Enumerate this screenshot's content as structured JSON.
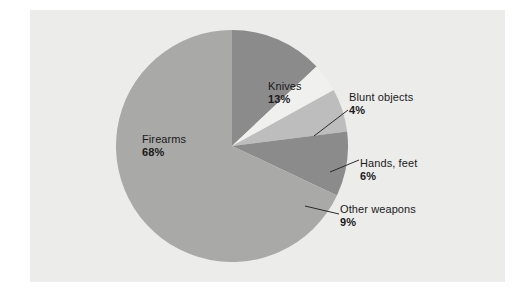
{
  "figure": {
    "background_color": "#ffffff",
    "panel_color": "#ececeb"
  },
  "chart_data": {
    "type": "pie",
    "title": "",
    "subtitle": "",
    "xlabel": "",
    "ylabel": "",
    "legend_position": "none",
    "grid": false,
    "units": "percent",
    "total": 100,
    "start_angle_deg": 0,
    "direction": "clockwise",
    "categories": [
      "Knives",
      "Blunt objects",
      "Hands, feet",
      "Other weapons",
      "Firearms"
    ],
    "values": [
      13,
      4,
      6,
      9,
      68
    ],
    "labels": [
      "13%",
      "4%",
      "6%",
      "9%",
      "68%"
    ],
    "colors": [
      "#8b8b8b",
      "#f0f0ee",
      "#bdbdbd",
      "#8b8b8b",
      "#a9a9a7"
    ],
    "slices": [
      {
        "name": "Knives",
        "value": 13,
        "label": "13%",
        "color": "#8b8b8b",
        "label_placement": "inside",
        "leader_line": false
      },
      {
        "name": "Blunt objects",
        "value": 4,
        "label": "4%",
        "color": "#f0f0ee",
        "label_placement": "outside",
        "leader_line": true
      },
      {
        "name": "Hands, feet",
        "value": 6,
        "label": "6%",
        "color": "#bdbdbd",
        "label_placement": "outside",
        "leader_line": true
      },
      {
        "name": "Other weapons",
        "value": 9,
        "label": "9%",
        "color": "#8b8b8b",
        "label_placement": "outside",
        "leader_line": true
      },
      {
        "name": "Firearms",
        "value": 68,
        "label": "68%",
        "color": "#a9a9a7",
        "label_placement": "inside",
        "leader_line": false
      }
    ]
  },
  "labels": {
    "firearms": {
      "name": "Firearms",
      "percent": "68%"
    },
    "knives": {
      "name": "Knives",
      "percent": "13%"
    },
    "blunt_objects": {
      "name": "Blunt objects",
      "percent": "4%"
    },
    "hands_feet": {
      "name": "Hands, feet",
      "percent": "6%"
    },
    "other_weapons": {
      "name": "Other weapons",
      "percent": "9%"
    }
  }
}
